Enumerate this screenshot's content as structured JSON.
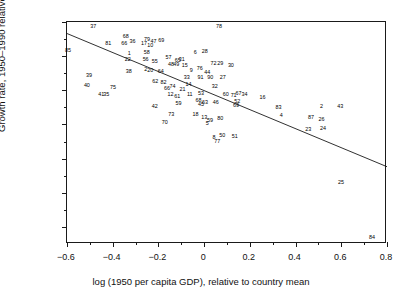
{
  "chart_data": {
    "type": "scatter",
    "title": "",
    "xlabel": "log (1950 per capita GDP), relative to country mean",
    "ylabel": "Growth rate, 1950–1990 relative to country mean",
    "xlim": [
      -0.6,
      0.8
    ],
    "ylim": [
      -0.018,
      0.008
    ],
    "grid": false,
    "legend": "none",
    "xticks": [
      -0.6,
      -0.4,
      -0.2,
      0,
      0.2,
      0.4,
      0.6,
      0.8
    ],
    "xtick_labels": [
      "−0.6",
      "−0.4",
      "−0.2",
      "0",
      "0.2",
      "0.4",
      "0.6",
      "0.8"
    ],
    "xminor_ticks": [
      -0.5,
      -0.3,
      -0.1,
      0.1,
      0.3,
      0.5,
      0.7
    ],
    "yticks": [
      0.008,
      0.004,
      0,
      -0.004,
      -0.008,
      -0.012,
      -0.016
    ],
    "ytick_labels": [
      "0·008",
      "0·004",
      "0",
      "−0·004",
      "−0·008",
      "−0·012",
      "−0·016"
    ],
    "yminor_ticks": [
      0.006,
      0.002,
      -0.002,
      -0.006,
      -0.01,
      -0.014
    ],
    "marker_style": "numeric-label",
    "fit_line": {
      "type": "linear-regression",
      "x_start": -0.6,
      "y_start": 0.00665,
      "x_end": 0.8,
      "y_end": -0.00895,
      "color": "#1a1a1a"
    },
    "points": [
      {
        "label": "37",
        "x": -0.485,
        "y": 0.00745
      },
      {
        "label": "85",
        "x": -0.596,
        "y": 0.00465
      },
      {
        "label": "81",
        "x": -0.419,
        "y": 0.00545
      },
      {
        "label": "68",
        "x": -0.343,
        "y": 0.00625
      },
      {
        "label": "66",
        "x": -0.35,
        "y": 0.00545
      },
      {
        "label": "36",
        "x": -0.313,
        "y": 0.0056
      },
      {
        "label": "1",
        "x": -0.328,
        "y": 0.0043
      },
      {
        "label": "22",
        "x": -0.334,
        "y": 0.0036
      },
      {
        "label": "79",
        "x": -0.25,
        "y": 0.00595
      },
      {
        "label": "17",
        "x": -0.263,
        "y": 0.00545
      },
      {
        "label": "10",
        "x": -0.236,
        "y": 0.0052
      },
      {
        "label": "47",
        "x": -0.222,
        "y": 0.0056
      },
      {
        "label": "69",
        "x": -0.188,
        "y": 0.0058
      },
      {
        "label": "58",
        "x": -0.251,
        "y": 0.0044
      },
      {
        "label": "56",
        "x": -0.256,
        "y": 0.00355
      },
      {
        "label": "55",
        "x": -0.216,
        "y": 0.0033
      },
      {
        "label": "38",
        "x": -0.33,
        "y": 0.00215
      },
      {
        "label": "2",
        "x": -0.256,
        "y": 0.0024
      },
      {
        "label": "20",
        "x": -0.236,
        "y": 0.0023
      },
      {
        "label": "57",
        "x": -0.156,
        "y": 0.00375
      },
      {
        "label": "65",
        "x": -0.115,
        "y": 0.00345
      },
      {
        "label": "31",
        "x": -0.098,
        "y": 0.0036
      },
      {
        "label": "6",
        "x": -0.039,
        "y": 0.00435
      },
      {
        "label": "28",
        "x": 0.003,
        "y": 0.0045
      },
      {
        "label": "78",
        "x": 0.065,
        "y": 0.0074
      },
      {
        "label": "48",
        "x": -0.145,
        "y": 0.00295
      },
      {
        "label": "49",
        "x": -0.122,
        "y": 0.00295
      },
      {
        "label": "15",
        "x": -0.085,
        "y": 0.0029
      },
      {
        "label": "64",
        "x": -0.19,
        "y": 0.00215
      },
      {
        "label": "9",
        "x": -0.056,
        "y": 0.0023
      },
      {
        "label": "76",
        "x": -0.019,
        "y": 0.0025
      },
      {
        "label": "72",
        "x": 0.041,
        "y": 0.0031
      },
      {
        "label": "29",
        "x": 0.07,
        "y": 0.0031
      },
      {
        "label": "30",
        "x": 0.117,
        "y": 0.0029
      },
      {
        "label": "44",
        "x": 0.014,
        "y": 0.00205
      },
      {
        "label": "91",
        "x": -0.016,
        "y": 0.0015
      },
      {
        "label": "90",
        "x": 0.027,
        "y": 0.0015
      },
      {
        "label": "27",
        "x": 0.081,
        "y": 0.0015
      },
      {
        "label": "33",
        "x": -0.076,
        "y": 0.0014
      },
      {
        "label": "62",
        "x": -0.214,
        "y": 0.00095
      },
      {
        "label": "82",
        "x": -0.178,
        "y": 0.0009
      },
      {
        "label": "74",
        "x": -0.138,
        "y": 0.0004
      },
      {
        "label": "14",
        "x": -0.068,
        "y": 0.00065
      },
      {
        "label": "39",
        "x": -0.504,
        "y": 0.0017
      },
      {
        "label": "40",
        "x": -0.513,
        "y": 0.00045
      },
      {
        "label": "75",
        "x": -0.399,
        "y": 0.00025
      },
      {
        "label": "66b",
        "x": -0.162,
        "y": 0.0001
      },
      {
        "label": "21",
        "x": -0.095,
        "y": 0.0
      },
      {
        "label": "32",
        "x": 0.046,
        "y": 0.0004
      },
      {
        "label": "41",
        "x": -0.45,
        "y": -0.00055
      },
      {
        "label": "35",
        "x": -0.428,
        "y": -0.00055
      },
      {
        "label": "12",
        "x": -0.147,
        "y": -0.00055
      },
      {
        "label": "61",
        "x": -0.118,
        "y": -0.00075
      },
      {
        "label": "11",
        "x": -0.063,
        "y": -0.00055
      },
      {
        "label": "53",
        "x": -0.014,
        "y": -0.0004
      },
      {
        "label": "60",
        "x": 0.095,
        "y": -0.0005
      },
      {
        "label": "71",
        "x": 0.129,
        "y": -0.0007
      },
      {
        "label": "67",
        "x": 0.15,
        "y": -0.00045
      },
      {
        "label": "34",
        "x": 0.177,
        "y": -0.0005
      },
      {
        "label": "16",
        "x": 0.255,
        "y": -0.00085
      },
      {
        "label": "68b",
        "x": -0.025,
        "y": -0.00125
      },
      {
        "label": "63",
        "x": 0.004,
        "y": -0.00145
      },
      {
        "label": "45",
        "x": -0.014,
        "y": -0.0017
      },
      {
        "label": "46",
        "x": 0.051,
        "y": -0.00145
      },
      {
        "label": "52",
        "x": 0.145,
        "y": -0.00135
      },
      {
        "label": "69b",
        "x": 0.139,
        "y": -0.0018
      },
      {
        "label": "42",
        "x": -0.216,
        "y": -0.00195
      },
      {
        "label": "59",
        "x": -0.112,
        "y": -0.00165
      },
      {
        "label": "83",
        "x": 0.325,
        "y": -0.00205
      },
      {
        "label": "2b",
        "x": 0.513,
        "y": -0.00195
      },
      {
        "label": "43",
        "x": 0.595,
        "y": -0.002
      },
      {
        "label": "73",
        "x": -0.144,
        "y": -0.00285
      },
      {
        "label": "18",
        "x": -0.038,
        "y": -0.00285
      },
      {
        "label": "13",
        "x": 0.0,
        "y": -0.0033
      },
      {
        "label": "59b",
        "x": 0.026,
        "y": -0.00355
      },
      {
        "label": "80",
        "x": 0.071,
        "y": -0.0034
      },
      {
        "label": "4",
        "x": 0.337,
        "y": -0.00305
      },
      {
        "label": "87",
        "x": 0.468,
        "y": -0.0033
      },
      {
        "label": "26",
        "x": 0.513,
        "y": -0.00345
      },
      {
        "label": "70",
        "x": -0.172,
        "y": -0.00385
      },
      {
        "label": "5",
        "x": 0.014,
        "y": -0.004
      },
      {
        "label": "23",
        "x": 0.455,
        "y": -0.00465
      },
      {
        "label": "24",
        "x": 0.52,
        "y": -0.0045
      },
      {
        "label": "8",
        "x": 0.043,
        "y": -0.00555
      },
      {
        "label": "50",
        "x": 0.079,
        "y": -0.0054
      },
      {
        "label": "51",
        "x": 0.134,
        "y": -0.0055
      },
      {
        "label": "77",
        "x": 0.057,
        "y": -0.00605
      },
      {
        "label": "25",
        "x": 0.599,
        "y": -0.01085
      },
      {
        "label": "84",
        "x": 0.734,
        "y": -0.01725
      }
    ]
  }
}
